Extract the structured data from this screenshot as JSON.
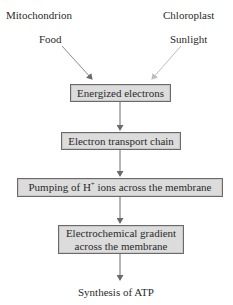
{
  "diagram": {
    "sources": [
      {
        "organelle": "Mitochondrion",
        "input": "Food"
      },
      {
        "organelle": "Chloroplast",
        "input": "Sunlight"
      }
    ],
    "steps": [
      {
        "label": "Energized electrons"
      },
      {
        "label": "Electron transport chain"
      },
      {
        "label_prefix": "Pumping of H",
        "label_sup": "+",
        "label_suffix": " ions across the membrane"
      },
      {
        "line1": "Electrochemical gradient",
        "line2": "across the membrane"
      }
    ],
    "output": "Synthesis of ATP",
    "colors": {
      "box_fill": "#dcdcdc",
      "box_border": "#6a6a6a",
      "arrow": "#6a6a6a",
      "text": "#2a2a2a"
    }
  }
}
